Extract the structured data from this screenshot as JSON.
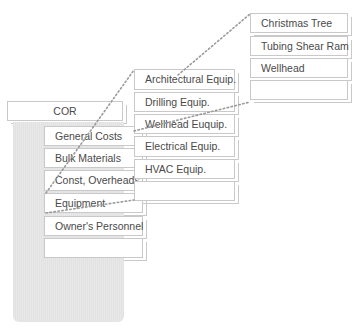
{
  "root": {
    "label": "COR"
  },
  "level1": {
    "items": [
      {
        "label": "General Costs"
      },
      {
        "label": "Bulk Materials"
      },
      {
        "label": "Const, Overheads"
      },
      {
        "label": "Equipment"
      },
      {
        "label": "Owner's Personnel"
      },
      {
        "label": ""
      }
    ]
  },
  "level2": {
    "parent": "Equipment",
    "items": [
      {
        "label": "Architectural Equip."
      },
      {
        "label": "Drilling Equip."
      },
      {
        "label": "Wellhead Euquip."
      },
      {
        "label": "Electrical Equip."
      },
      {
        "label": "HVAC Equip."
      },
      {
        "label": ""
      }
    ]
  },
  "level3": {
    "parent": "Wellhead Euquip.",
    "items": [
      {
        "label": "Christmas Tree"
      },
      {
        "label": "Tubing Shear Ram"
      },
      {
        "label": "Wellhead"
      },
      {
        "label": ""
      }
    ]
  },
  "colors": {
    "border": "#c9c9c9",
    "panel": "#e4e4e4",
    "connector": "#9a9a9a",
    "text": "#4a4a4a"
  }
}
